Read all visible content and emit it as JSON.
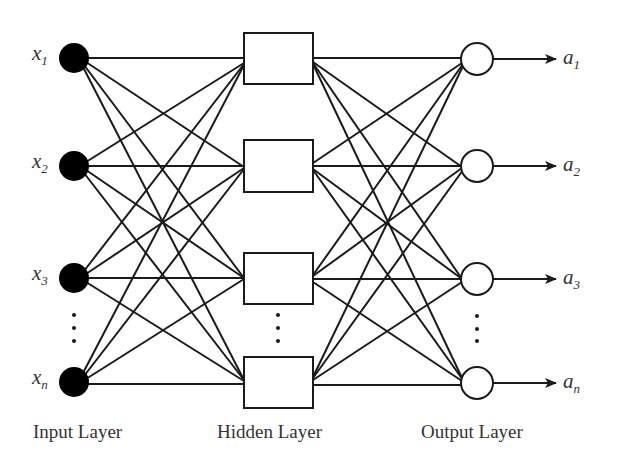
{
  "diagram": {
    "input_layer": {
      "label": "Input Layer",
      "nodes": [
        {
          "var": "x",
          "sub": "1"
        },
        {
          "var": "x",
          "sub": "2"
        },
        {
          "var": "x",
          "sub": "3"
        },
        {
          "var": "x",
          "sub": "n"
        }
      ],
      "node_shape": "filled-circle",
      "ellipsis": "⋮"
    },
    "hidden_layer": {
      "label": "Hidden Layer",
      "node_count_shown": 4,
      "node_shape": "rectangle",
      "ellipsis": "⋮"
    },
    "output_layer": {
      "label": "Output Layer",
      "nodes": [
        {
          "var": "a",
          "sub": "1"
        },
        {
          "var": "a",
          "sub": "2"
        },
        {
          "var": "a",
          "sub": "3"
        },
        {
          "var": "a",
          "sub": "n"
        }
      ],
      "node_shape": "open-circle",
      "ellipsis": "⋮"
    },
    "connections": "fully-connected",
    "colors": {
      "stroke": "#1a1a1a",
      "input_fill": "#000000",
      "node_fill": "#ffffff",
      "text": "#333333"
    }
  }
}
